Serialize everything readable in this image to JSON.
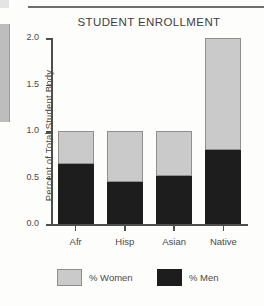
{
  "chart_data": {
    "type": "bar",
    "title": "STUDENT ENROLLMENT",
    "xlabel": "",
    "ylabel": "Percent of Total Student Body",
    "categories": [
      "Afr",
      "Hisp",
      "Asian",
      "Native"
    ],
    "ylim": [
      0.0,
      2.0
    ],
    "yticks": [
      "0.0",
      "0.5",
      "1.0",
      "1.5",
      "2.0"
    ],
    "ytick_values": [
      0.0,
      0.5,
      1.0,
      1.5,
      2.0
    ],
    "grid": false,
    "stacked": true,
    "legend_position": "bottom",
    "series": [
      {
        "name": "% Men",
        "color": "#1d1d1d",
        "values": [
          0.65,
          0.46,
          0.52,
          0.8
        ]
      },
      {
        "name": "% Women",
        "color": "#cacaca",
        "values": [
          0.35,
          0.54,
          0.48,
          1.2
        ]
      }
    ],
    "totals": [
      1.0,
      1.0,
      1.0,
      2.0
    ]
  },
  "legend": {
    "items": [
      {
        "label": "% Women",
        "color": "#cacaca"
      },
      {
        "label": "% Men",
        "color": "#1d1d1d"
      }
    ]
  }
}
